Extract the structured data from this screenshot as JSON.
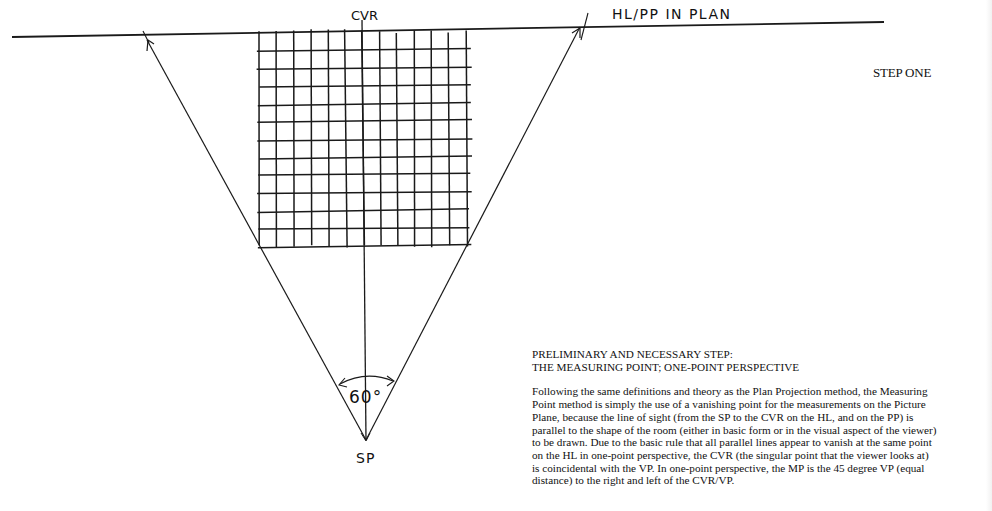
{
  "diagram": {
    "labels": {
      "cvr": "CVR",
      "hl_pp": "HL/PP IN PLAN",
      "sp": "SP",
      "angle": "60°"
    },
    "step_title": "STEP ONE",
    "grid": {
      "columns": 12,
      "rows": 12
    },
    "cone_of_vision_degrees": 60,
    "stroke_color": "#1a1a1a",
    "background_color": "#ffffff"
  },
  "text": {
    "heading_line1": "PRELIMINARY AND NECESSARY STEP:",
    "heading_line2": "THE MEASURING POINT; ONE-POINT PERSPECTIVE",
    "paragraph": "Following the same definitions and theory as the Plan Projection method, the Measuring Point method is simply the use of a vanishing point for the measurements on the Picture Plane, because the line of sight (from the SP to the CVR on the HL, and on the PP) is parallel to the shape of the room (either in basic form or in the visual aspect of the viewer) to be drawn.  Due to the basic rule that all parallel lines appear to vanish at the same point on the HL in one-point perspective, the CVR (the singular point that the viewer looks at) is coincidental with the VP.  In one-point perspective, the MP is the 45 degree VP (equal distance) to the right and left of the CVR/VP.",
    "paragraph_lines": [
      "Following the same definitions and theory as the Plan Projection method, the Measuring",
      "Point method is simply the use of a vanishing point for the measurements on the Picture",
      "Plane, because the line of sight (from the SP to the CVR on the HL, and on the PP) is",
      "parallel to the shape of the room (either in basic form or in the visual aspect of the viewer)",
      "to be drawn.  Due to the basic rule that all parallel lines appear to vanish at the same point",
      "on the HL in one-point perspective, the CVR (the singular point that the viewer looks at)",
      "is coincidental with the VP.  In one-point perspective, the MP is the 45 degree VP (equal",
      "distance) to the right and left of the CVR/VP."
    ]
  }
}
